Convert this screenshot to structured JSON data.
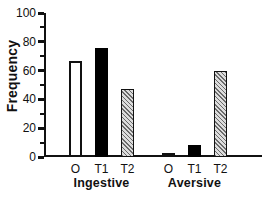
{
  "chart_data": {
    "type": "bar",
    "title": "",
    "ylabel": "Frequency",
    "xlabel": "",
    "ylim": [
      0,
      100
    ],
    "y_axis": {
      "major_ticks": [
        0,
        20,
        40,
        60,
        80,
        100
      ],
      "minor_ticks": [
        10,
        30,
        50,
        70,
        90
      ]
    },
    "grid": false,
    "legend_position": "none",
    "categories": [
      "Ingestive",
      "Aversive"
    ],
    "series": [
      {
        "name": "O",
        "style": "open",
        "values": [
          67,
          3
        ]
      },
      {
        "name": "T1",
        "style": "solid",
        "values": [
          76,
          8
        ]
      },
      {
        "name": "T2",
        "style": "hatch",
        "values": [
          47,
          60
        ]
      }
    ],
    "colors": {
      "open_fill": "#ffffff",
      "solid_fill": "#000000",
      "hatch_fg": "#6a6a6a",
      "hatch_bg": "#dcdcdc",
      "axis": "#111111",
      "text": "#111111"
    }
  }
}
